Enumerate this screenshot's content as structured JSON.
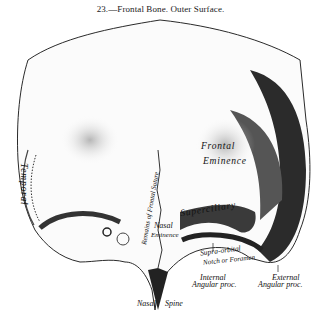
{
  "figure": {
    "caption": "23.—Frontal Bone.   Outer Surface.",
    "labels": {
      "temporal": "Temporal",
      "remains_frontal_suture": "Remains of Frontal Suture",
      "frontal_eminence_1": "Frontal",
      "frontal_eminence_2": "Eminence",
      "superciliary": "Superciliary",
      "nasal_eminence_1": "Nasal",
      "nasal_eminence_2": "Eminence",
      "supraorbital_1": "Supra-orbital",
      "supraorbital_2": "Notch or Foramen",
      "internal_angular_1": "Internal",
      "internal_angular_2": "Angular proc.",
      "external_angular_1": "External",
      "external_angular_2": "Angular proc.",
      "nasal_spine_1": "Nasal",
      "nasal_spine_2": "Spine"
    }
  }
}
